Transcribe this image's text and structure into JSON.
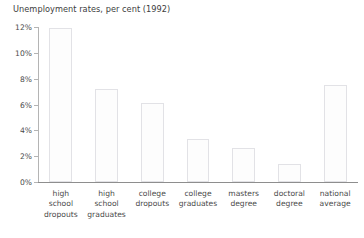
{
  "chart_data": {
    "type": "bar",
    "title": "Unemployment rates, per cent (1992)",
    "xlabel": "",
    "ylabel": "",
    "ylim": [
      0,
      12
    ],
    "ytick_values": [
      0,
      2,
      4,
      6,
      8,
      10,
      12
    ],
    "ytick_labels": [
      "0%",
      "2%",
      "4%",
      "6%",
      "8%",
      "10%",
      "12%"
    ],
    "grid": false,
    "legend": false,
    "categories": [
      "high school dropouts",
      "high school graduates",
      "college dropouts",
      "college graduates",
      "masters degree",
      "doctoral degree",
      "national average"
    ],
    "category_lines": [
      [
        "high",
        "school",
        "dropouts"
      ],
      [
        "high",
        "school",
        "graduates"
      ],
      [
        "college",
        "dropouts"
      ],
      [
        "college",
        "graduates"
      ],
      [
        "masters",
        "degree"
      ],
      [
        "doctoral",
        "degree"
      ],
      [
        "national",
        "average"
      ]
    ],
    "values": [
      11.9,
      7.2,
      6.1,
      3.3,
      2.6,
      1.4,
      7.5
    ],
    "colors": {
      "bar_fill": "#fdfdfd",
      "bar_border": "#e2e2e6",
      "axis": "#8e8e8e",
      "text": "#4a4a4a",
      "background": "#ffffff"
    }
  }
}
